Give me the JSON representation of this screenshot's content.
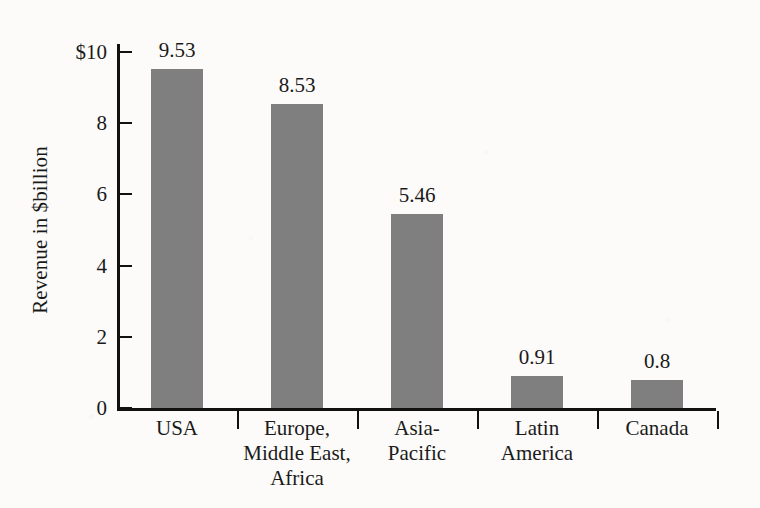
{
  "chart_data": {
    "type": "bar",
    "title": "",
    "subtitle": "",
    "xlabel": "",
    "ylabel": "Revenue in $billion",
    "categories": [
      "USA",
      "Europe,\nMiddle East,\nAfrica",
      "Asia-\nPacific",
      "Latin\nAmerica",
      "Canada"
    ],
    "category_lines": [
      [
        "USA"
      ],
      [
        "Europe,",
        "Middle East,",
        "Africa"
      ],
      [
        "Asia-",
        "Pacific"
      ],
      [
        "Latin",
        "America"
      ],
      [
        "Canada"
      ]
    ],
    "values": [
      9.53,
      8.53,
      5.46,
      0.91,
      0.8
    ],
    "value_labels": [
      "9.53",
      "8.53",
      "5.46",
      "0.91",
      "0.8"
    ],
    "ylim": [
      0,
      10
    ],
    "y_ticks": [
      0,
      2,
      4,
      6,
      8,
      10
    ],
    "y_tick_labels": [
      "0",
      "2",
      "4",
      "6",
      "8",
      "$10"
    ],
    "grid": false,
    "legend": null,
    "bar_color": "#7f7f7f",
    "axis_color": "#111111",
    "background_color": "#fcfbf9"
  }
}
